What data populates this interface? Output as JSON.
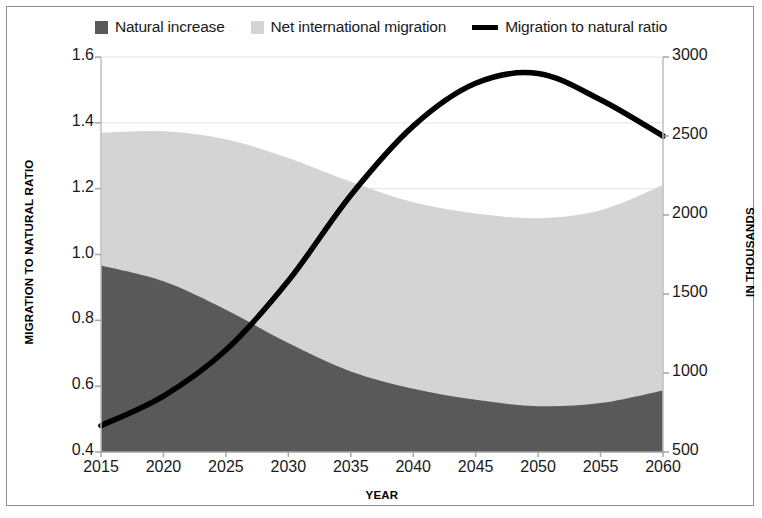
{
  "legend": {
    "items": [
      {
        "label": "Natural increase",
        "marker": "square-swatch",
        "color": "#595959"
      },
      {
        "label": "Net international migration",
        "marker": "square-swatch",
        "color": "#d4d4d4"
      },
      {
        "label": "Migration to natural ratio",
        "marker": "line-swatch",
        "color": "#000000"
      }
    ]
  },
  "axes": {
    "y_left_title": "MIGRATION TO NATURAL RATIO",
    "y_right_title": "IN THOUSANDS",
    "x_title": "YEAR",
    "y_left_ticks": [
      "1.6",
      "1.4",
      "1.2",
      "1.0",
      "0.8",
      "0.6",
      "0.4"
    ],
    "y_right_ticks": [
      "3000",
      "2500",
      "2000",
      "1500",
      "1000",
      "500"
    ],
    "x_ticks": [
      "2015",
      "2020",
      "2025",
      "2030",
      "2035",
      "2040",
      "2045",
      "2050",
      "2055",
      "2060"
    ]
  },
  "chart_data": {
    "type": "area",
    "title": "",
    "xlabel": "YEAR",
    "ylabel": "MIGRATION TO NATURAL RATIO",
    "y2label": "IN THOUSANDS",
    "grid": true,
    "legend_position": "top",
    "x": [
      2015,
      2020,
      2025,
      2030,
      2035,
      2040,
      2045,
      2050,
      2055,
      2060
    ],
    "xlim": [
      2015,
      2060
    ],
    "ylim": [
      0.4,
      1.6
    ],
    "y2lim": [
      500,
      3000
    ],
    "series": [
      {
        "name": "Natural increase",
        "type": "area",
        "stacked": true,
        "axis": "right",
        "units": "thousands",
        "color": "#595959",
        "values": [
          1680,
          1580,
          1400,
          1190,
          1010,
          900,
          830,
          790,
          810,
          890
        ]
      },
      {
        "name": "Net international migration",
        "type": "area",
        "stacked": true,
        "axis": "right",
        "units": "thousands",
        "color": "#d4d4d4",
        "values": [
          840,
          950,
          1080,
          1170,
          1200,
          1180,
          1180,
          1190,
          1220,
          1300
        ]
      },
      {
        "name": "Migration to natural ratio",
        "type": "line",
        "axis": "left",
        "color": "#000000",
        "values": [
          0.48,
          0.57,
          0.71,
          0.92,
          1.18,
          1.39,
          1.52,
          1.55,
          1.47,
          1.36
        ]
      }
    ],
    "stack_totals": [
      2520,
      2530,
      2480,
      2360,
      2210,
      2080,
      2010,
      1980,
      2030,
      2190
    ],
    "annotations": []
  }
}
